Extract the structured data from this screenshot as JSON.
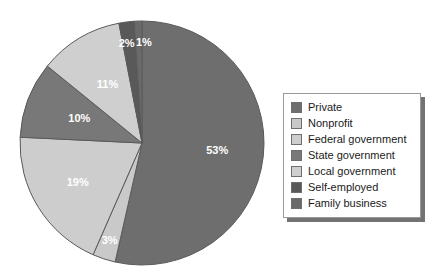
{
  "chart_data": {
    "type": "pie",
    "title": "",
    "subtitle": "",
    "xlabel": "",
    "ylabel": "",
    "grid": false,
    "legend_position": "right",
    "units": "percent",
    "total": 99,
    "start_angle_deg": 0,
    "direction": "clockwise",
    "categories": [
      "Private",
      "Nonprofit",
      "Federal government",
      "State government",
      "Local government",
      "Self-employed",
      "Family business"
    ],
    "values": [
      53,
      3,
      19,
      10,
      11,
      2,
      1
    ],
    "data_labels": [
      "53%",
      "3%",
      "19%",
      "10%",
      "11%",
      "2%",
      "1%"
    ],
    "colors": [
      "#6e6e6e",
      "#c9c9c9",
      "#cdcdcd",
      "#787878",
      "#cfcfcf",
      "#595959",
      "#6a6a6a"
    ],
    "slices": [
      {
        "label": "Private",
        "value": 53,
        "data_label": "53%",
        "color": "#6e6e6e",
        "label_color": "#ffffff"
      },
      {
        "label": "Nonprofit",
        "value": 3,
        "data_label": "3%",
        "color": "#c9c9c9",
        "label_color": "#ffffff"
      },
      {
        "label": "Federal government",
        "value": 19,
        "data_label": "19%",
        "color": "#cdcdcd",
        "label_color": "#ffffff"
      },
      {
        "label": "State government",
        "value": 10,
        "data_label": "10%",
        "color": "#787878",
        "label_color": "#ffffff"
      },
      {
        "label": "Local government",
        "value": 11,
        "data_label": "11%",
        "color": "#cfcfcf",
        "label_color": "#ffffff"
      },
      {
        "label": "Self-employed",
        "value": 2,
        "data_label": "2%",
        "color": "#595959",
        "label_color": "#ffffff"
      },
      {
        "label": "Family business",
        "value": 1,
        "data_label": "1%",
        "color": "#6a6a6a",
        "label_color": "#ffffff"
      }
    ]
  },
  "legend": {
    "items": [
      {
        "label": "Private",
        "color": "#6e6e6e"
      },
      {
        "label": "Nonprofit",
        "color": "#c9c9c9"
      },
      {
        "label": "Federal government",
        "color": "#cdcdcd"
      },
      {
        "label": "State government",
        "color": "#787878"
      },
      {
        "label": "Local government",
        "color": "#cfcfcf"
      },
      {
        "label": "Self-employed",
        "color": "#595959"
      },
      {
        "label": "Family business",
        "color": "#6a6a6a"
      }
    ]
  },
  "geometry": {
    "center_x": 142,
    "center_y": 143,
    "radius": 122,
    "outline_color": "#5a5a5a",
    "background": "#ffffff"
  }
}
